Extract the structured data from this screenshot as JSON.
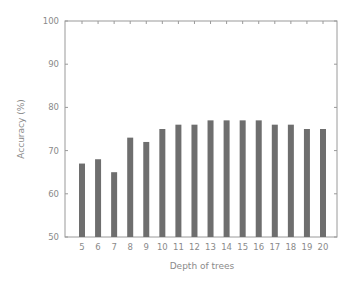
{
  "chart_data": {
    "type": "bar",
    "title": "",
    "xlabel": "Depth of trees",
    "ylabel": "Accuracy (%)",
    "ylim": [
      50,
      100
    ],
    "yticks": [
      50,
      60,
      70,
      80,
      90,
      100
    ],
    "grid": false,
    "legend": null,
    "categories": [
      "5",
      "6",
      "7",
      "8",
      "9",
      "10",
      "11",
      "12",
      "13",
      "14",
      "15",
      "16",
      "17",
      "18",
      "19",
      "20"
    ],
    "values": [
      67,
      68,
      65,
      73,
      72,
      75,
      76,
      76,
      77,
      77,
      77,
      77,
      76,
      76,
      75,
      75
    ],
    "bar_color": "#6e6e6e",
    "axis_color": "#9a9a9a"
  }
}
